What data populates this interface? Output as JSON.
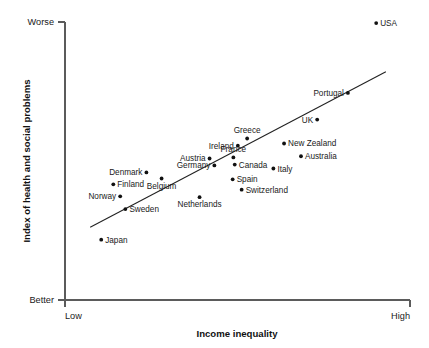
{
  "chart_data": {
    "type": "scatter",
    "title": "",
    "xlabel": "Income inequality",
    "ylabel": "Index of health and social problems",
    "x_tick_labels": [
      "Low",
      "High"
    ],
    "y_tick_labels": [
      "Better",
      "Worse"
    ],
    "grid": false,
    "legend": "none",
    "xlim": [
      0,
      1
    ],
    "ylim": [
      0,
      1
    ],
    "axis_note": "Axes are qualitative: x runs Low to High income inequality, y runs Better to Worse index of health and social problems.",
    "trend_line": {
      "label": "regression-line",
      "x_start": 0.073,
      "y_start": 0.262,
      "x_end": 0.93,
      "y_end": 0.821
    },
    "points": [
      {
        "label": "USA",
        "x": 0.902,
        "y": 0.996,
        "label_side": "right"
      },
      {
        "label": "Portugal",
        "x": 0.82,
        "y": 0.745,
        "label_side": "left"
      },
      {
        "label": "UK",
        "x": 0.731,
        "y": 0.649,
        "label_side": "left"
      },
      {
        "label": "Greece",
        "x": 0.528,
        "y": 0.581,
        "label_side": "above"
      },
      {
        "label": "New Zealand",
        "x": 0.635,
        "y": 0.563,
        "label_side": "right"
      },
      {
        "label": "Ireland",
        "x": 0.501,
        "y": 0.555,
        "label_side": "left"
      },
      {
        "label": "France",
        "x": 0.488,
        "y": 0.513,
        "label_side": "above"
      },
      {
        "label": "Australia",
        "x": 0.684,
        "y": 0.517,
        "label_side": "right"
      },
      {
        "label": "Austria",
        "x": 0.419,
        "y": 0.509,
        "label_side": "left"
      },
      {
        "label": "Canada",
        "x": 0.492,
        "y": 0.487,
        "label_side": "right"
      },
      {
        "label": "Germany",
        "x": 0.433,
        "y": 0.484,
        "label_side": "left"
      },
      {
        "label": "Italy",
        "x": 0.604,
        "y": 0.473,
        "label_side": "right"
      },
      {
        "label": "Denmark",
        "x": 0.236,
        "y": 0.459,
        "label_side": "left"
      },
      {
        "label": "Belgium",
        "x": 0.28,
        "y": 0.437,
        "label_side": "below"
      },
      {
        "label": "Spain",
        "x": 0.486,
        "y": 0.434,
        "label_side": "right"
      },
      {
        "label": "Finland",
        "x": 0.14,
        "y": 0.416,
        "label_side": "right"
      },
      {
        "label": "Switzerland",
        "x": 0.512,
        "y": 0.397,
        "label_side": "right"
      },
      {
        "label": "Norway",
        "x": 0.16,
        "y": 0.373,
        "label_side": "left"
      },
      {
        "label": "Netherlands",
        "x": 0.39,
        "y": 0.37,
        "label_side": "below"
      },
      {
        "label": "Sweden",
        "x": 0.175,
        "y": 0.327,
        "label_side": "right"
      },
      {
        "label": "Japan",
        "x": 0.105,
        "y": 0.217,
        "label_side": "right"
      }
    ]
  }
}
